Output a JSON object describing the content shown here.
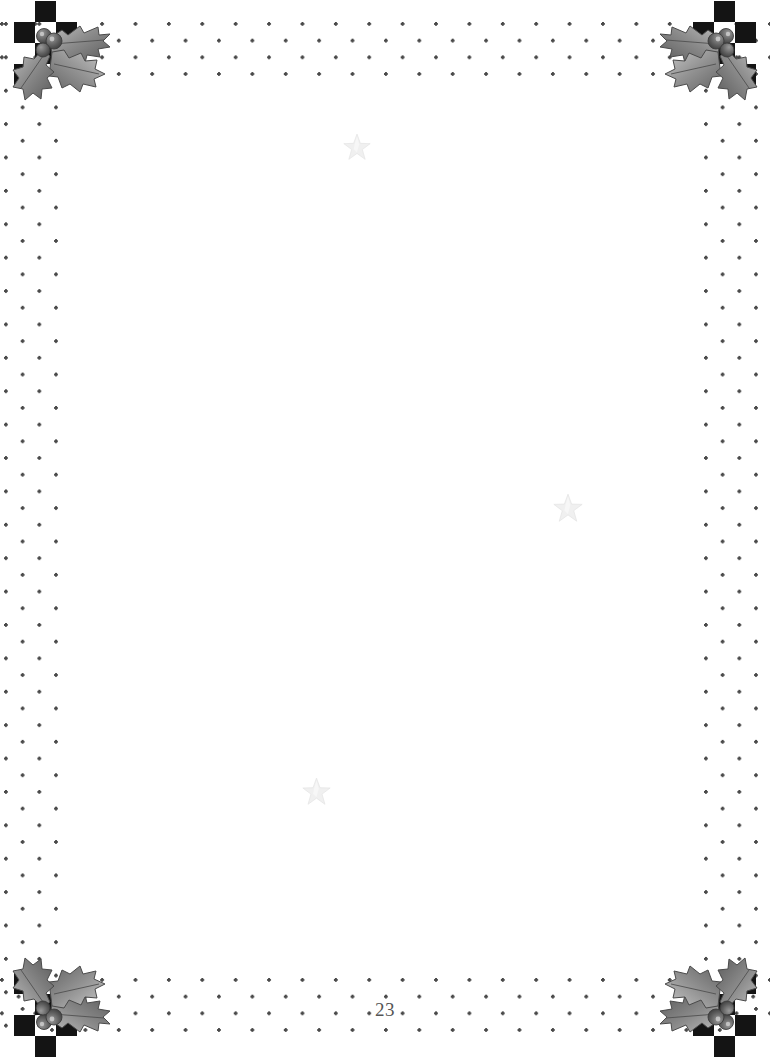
{
  "page": {
    "width": 770,
    "height": 1058,
    "background_color": "#ffffff",
    "page_number": "23",
    "page_number_color": "#555555"
  },
  "border": {
    "style_name": "holly-checkerboard-dotted-border",
    "dot_color": "#3a3a3a",
    "checker_color": "#141414",
    "bands": [
      {
        "name": "top",
        "rows": 4
      },
      {
        "name": "bottom",
        "rows": 5
      },
      {
        "name": "left",
        "columns": 3
      },
      {
        "name": "right",
        "columns": 3
      }
    ]
  },
  "corners": [
    {
      "name": "top-left",
      "ornament": "holly-sprig",
      "checker": true
    },
    {
      "name": "top-right",
      "ornament": "holly-sprig",
      "checker": true
    },
    {
      "name": "bottom-left",
      "ornament": "holly-sprig",
      "checker": true
    },
    {
      "name": "bottom-right",
      "ornament": "holly-sprig",
      "checker": true
    }
  ],
  "content": {
    "text": "",
    "watermarks": [
      {
        "name": "star-1",
        "shape": "five-point-star",
        "x": 356,
        "y": 146,
        "size": 26,
        "color": "#b8b8b8"
      },
      {
        "name": "star-2",
        "shape": "five-point-star",
        "x": 567,
        "y": 507,
        "size": 28,
        "color": "#b8b8b8"
      },
      {
        "name": "star-3",
        "shape": "five-point-star",
        "x": 316,
        "y": 791,
        "size": 27,
        "color": "#b8b8b8"
      }
    ]
  },
  "colors": {
    "holly_leaf_dark": "#5d5d5d",
    "holly_leaf_mid": "#8e8e8e",
    "holly_leaf_light": "#c2c2c2",
    "holly_berry": "#4a4a4a",
    "star_fill": "#cfcfcf",
    "star_stroke": "#a9a9a9"
  }
}
